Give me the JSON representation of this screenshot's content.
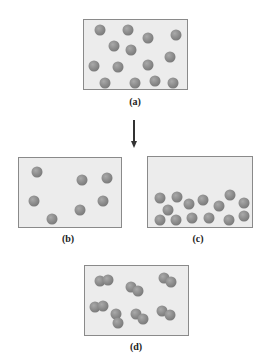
{
  "figure": {
    "panels": [
      {
        "id": "a",
        "label": "(a)",
        "box": {
          "x": 83,
          "y": 19,
          "w": 105,
          "h": 71
        },
        "label_pos": {
          "x": 135,
          "y": 96
        },
        "particles": [
          [
            100,
            30
          ],
          [
            128,
            30
          ],
          [
            148,
            38
          ],
          [
            176,
            35
          ],
          [
            114,
            46
          ],
          [
            131,
            50
          ],
          [
            94,
            66
          ],
          [
            118,
            67
          ],
          [
            148,
            65
          ],
          [
            170,
            57
          ],
          [
            105,
            83
          ],
          [
            135,
            83
          ],
          [
            155,
            81
          ],
          [
            173,
            83
          ]
        ]
      },
      {
        "id": "b",
        "label": "(b)",
        "box": {
          "x": 18,
          "y": 157,
          "w": 104,
          "h": 71
        },
        "label_pos": {
          "x": 68,
          "y": 233
        },
        "particles": [
          [
            37,
            172
          ],
          [
            82,
            180
          ],
          [
            107,
            178
          ],
          [
            34,
            201
          ],
          [
            80,
            210
          ],
          [
            103,
            201
          ],
          [
            52,
            219
          ]
        ]
      },
      {
        "id": "c",
        "label": "(c)",
        "box": {
          "x": 147,
          "y": 156,
          "w": 106,
          "h": 72
        },
        "label_pos": {
          "x": 198,
          "y": 233
        },
        "particles": [
          [
            160,
            198
          ],
          [
            177,
            197
          ],
          [
            189,
            204
          ],
          [
            203,
            200
          ],
          [
            230,
            195
          ],
          [
            244,
            203
          ],
          [
            168,
            210
          ],
          [
            219,
            206
          ],
          [
            160,
            220
          ],
          [
            176,
            220
          ],
          [
            192,
            218
          ],
          [
            209,
            218
          ],
          [
            229,
            220
          ],
          [
            244,
            216
          ]
        ]
      },
      {
        "id": "d",
        "label": "(d)",
        "box": {
          "x": 84,
          "y": 265,
          "w": 105,
          "h": 71
        },
        "label_pos": {
          "x": 136,
          "y": 341
        },
        "particles": [
          [
            100,
            281
          ],
          [
            108,
            280
          ],
          [
            131,
            287
          ],
          [
            138,
            291
          ],
          [
            164,
            278
          ],
          [
            171,
            282
          ],
          [
            95,
            307
          ],
          [
            103,
            306
          ],
          [
            116,
            314
          ],
          [
            118,
            323
          ],
          [
            136,
            314
          ],
          [
            143,
            319
          ],
          [
            162,
            311
          ],
          [
            170,
            315
          ]
        ]
      }
    ],
    "arrow": {
      "x": 134,
      "y1": 120,
      "y2": 148,
      "direction": "down"
    }
  }
}
